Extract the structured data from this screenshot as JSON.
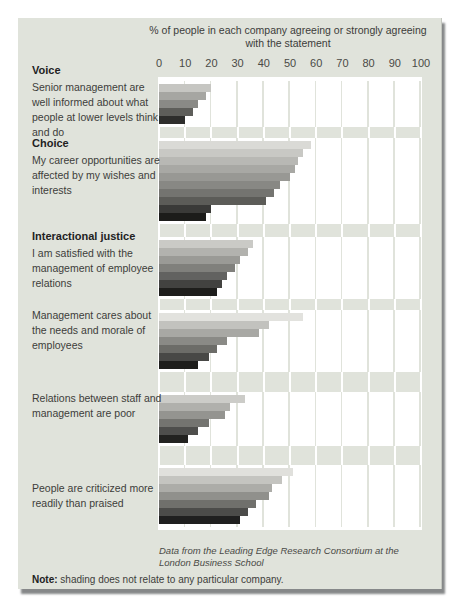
{
  "window": {
    "width": 459,
    "height": 607
  },
  "colors": {
    "panel_background": "#e0e3db",
    "row_background": "#ffffff",
    "gridline_on_white": "#e0e3db",
    "gridline_on_gray": "#ffffff",
    "edge_shadow": "#68686c",
    "text": "#3d3d3a"
  },
  "title": {
    "line1": "% of people in each company agreeing or strongly agreeing",
    "line2": "with the statement"
  },
  "axis": {
    "ticks": [
      "0",
      "10",
      "20",
      "30",
      "40",
      "50",
      "60",
      "70",
      "80",
      "90",
      "100"
    ]
  },
  "footer": {
    "source": "Data from the Leading Edge Research Consortium at the London Business School"
  },
  "note": {
    "prefix": "Note:",
    "text": " shading does not relate to any particular company."
  },
  "chart_data": {
    "type": "bar",
    "orientation": "horizontal",
    "title": "% of people in each company agreeing or strongly agreeing with the statement",
    "xlim": [
      0,
      100
    ],
    "x_ticks": [
      0,
      10,
      20,
      30,
      40,
      50,
      60,
      70,
      80,
      90,
      100
    ],
    "grid": true,
    "legend": false,
    "groups": [
      {
        "section": "Voice",
        "statement": "Senior management are well informed about what people at lower levels think and do",
        "values": [
          20,
          18,
          15,
          13,
          10
        ],
        "shades": [
          "#c6c6c2",
          "#a6a6a2",
          "#8a8a86",
          "#5e5e5a",
          "#2e2e2c"
        ]
      },
      {
        "section": "Choice",
        "statement": "My career opportunities are affected by my wishes and interests",
        "values": [
          58,
          55,
          53,
          52,
          50,
          46,
          44,
          41,
          20,
          18
        ],
        "shades": [
          "#dadad6",
          "#c8c8c4",
          "#b8b8b4",
          "#a8a8a4",
          "#989894",
          "#888884",
          "#747470",
          "#5c5c58",
          "#3a3a38",
          "#1c1c1a"
        ]
      },
      {
        "section": "Interactional justice",
        "statement": "I am satisfied with the management of employee relations",
        "values": [
          36,
          34,
          31,
          29,
          26,
          24,
          22
        ],
        "shades": [
          "#cacac6",
          "#b2b2ae",
          "#9a9a96",
          "#80807c",
          "#626260",
          "#424240",
          "#1e1e1c"
        ]
      },
      {
        "section": "",
        "statement": "Management cares about the needs and morale of employees",
        "values": [
          55,
          42,
          38,
          26,
          22,
          19,
          15
        ],
        "shades": [
          "#e2e2de",
          "#c2c2be",
          "#a8a8a4",
          "#8a8a86",
          "#6c6c68",
          "#484846",
          "#1e1e1c"
        ]
      },
      {
        "section": "",
        "statement": "Relations between staff and management are poor",
        "values": [
          33,
          27,
          25,
          19,
          15,
          11
        ],
        "shades": [
          "#ccccc8",
          "#b0b0ac",
          "#949490",
          "#747470",
          "#4e4e4c",
          "#222220"
        ]
      },
      {
        "section": "",
        "statement": "People are criticized more readily than praised",
        "values": [
          51,
          47,
          43,
          42,
          37,
          34,
          31
        ],
        "shades": [
          "#e0e0dc",
          "#c4c4c0",
          "#acaca8",
          "#90908c",
          "#70706c",
          "#4c4c4a",
          "#202020"
        ]
      }
    ],
    "source": "Data from the Leading Edge Research Consortium at the London Business School",
    "note": "shading does not relate to any particular company."
  }
}
